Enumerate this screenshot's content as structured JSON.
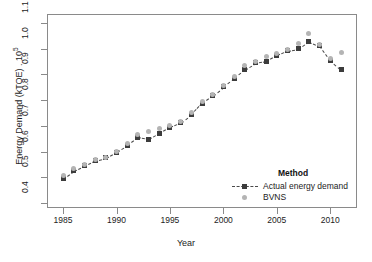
{
  "chart_data": {
    "type": "scatter",
    "title": "",
    "xlabel": "Year",
    "ylabel_text": "Energy Demand (kTOE) . 10",
    "ylabel_exponent": "5",
    "xlim": [
      1983.5,
      2012.5
    ],
    "ylim": [
      0.38,
      1.135
    ],
    "xticks": [
      1985,
      1990,
      1995,
      2000,
      2005,
      2010
    ],
    "yticks": [
      0.4,
      0.5,
      0.6,
      0.7,
      0.8,
      0.9,
      1.0,
      1.1
    ],
    "ytick_labels": [
      "0.4",
      "0.5",
      "0.6",
      "0.7",
      "0.8",
      "0.9",
      "1.0",
      "1.1"
    ],
    "xtick_labels": [
      "1985",
      "1990",
      "1995",
      "2000",
      "2005",
      "2010"
    ],
    "grid": false,
    "legend_position": "bottom-right",
    "legend_title": "Method",
    "x": [
      1985,
      1986,
      1987,
      1988,
      1989,
      1990,
      1991,
      1992,
      1993,
      1994,
      1995,
      1996,
      1997,
      1998,
      1999,
      2000,
      2001,
      2002,
      2003,
      2004,
      2005,
      2006,
      2007,
      2008,
      2009,
      2010,
      2011
    ],
    "series": [
      {
        "name": "Actual energy demand",
        "marker": "square",
        "color": "#3c3c3c",
        "line": "dashed",
        "values": [
          0.495,
          0.525,
          0.545,
          0.565,
          0.575,
          0.598,
          0.625,
          0.655,
          0.648,
          0.672,
          0.695,
          0.712,
          0.745,
          0.788,
          0.818,
          0.852,
          0.885,
          0.918,
          0.945,
          0.952,
          0.975,
          0.992,
          1.0,
          1.028,
          1.012,
          0.955,
          0.918
        ]
      },
      {
        "name": "BVNS",
        "marker": "circle",
        "color": "#b4b4b4",
        "line": "none",
        "values": [
          0.505,
          0.532,
          0.548,
          0.568,
          0.578,
          0.602,
          0.632,
          0.668,
          0.678,
          0.69,
          0.7,
          0.718,
          0.752,
          0.795,
          0.822,
          0.858,
          0.892,
          0.935,
          0.952,
          0.968,
          0.982,
          0.998,
          1.022,
          1.06,
          1.018,
          0.962,
          0.985
        ]
      }
    ]
  }
}
